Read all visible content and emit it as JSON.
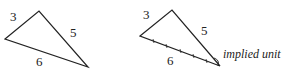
{
  "diagram": {
    "left_triangle": {
      "side_labels": {
        "a": "3",
        "b": "5",
        "c": "6"
      }
    },
    "right_triangle": {
      "side_labels": {
        "a": "3",
        "b": "5",
        "c": "6"
      },
      "annotation": "implied unit"
    },
    "stroke_color": "#222222"
  }
}
